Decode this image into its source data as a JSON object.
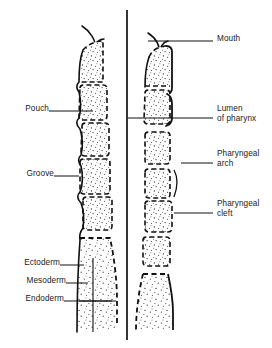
{
  "figure": {
    "ink_color": "#111111",
    "stipple_color": "#2b2b2b",
    "background": "#ffffff",
    "divider": {
      "x": 127,
      "y1": 10,
      "y2": 340
    }
  },
  "labels_left": [
    {
      "id": "pouch",
      "text": "Pouch",
      "x": 10,
      "y": 104,
      "leader": {
        "x1": 49,
        "y1": 111,
        "x2": 93,
        "y2": 111
      }
    },
    {
      "id": "groove",
      "text": "Groove",
      "x": 10,
      "y": 169,
      "leader": {
        "x1": 54,
        "y1": 176,
        "x2": 78,
        "y2": 176
      }
    },
    {
      "id": "ectoderm",
      "text": "Ectoderm",
      "x": 10,
      "y": 258,
      "leader": {
        "x1": 60,
        "y1": 265,
        "x2": 83,
        "y2": 265
      }
    },
    {
      "id": "mesoderm",
      "text": "Mesoderm",
      "x": 10,
      "y": 276,
      "leader": {
        "x1": 66,
        "y1": 283,
        "x2": 86,
        "y2": 283
      }
    },
    {
      "id": "endoderm",
      "text": "Endoderm",
      "x": 10,
      "y": 294,
      "leader": {
        "x1": 64,
        "y1": 301,
        "x2": 110,
        "y2": 301
      }
    }
  ],
  "labels_right": [
    {
      "id": "mouth",
      "text": "Mouth",
      "text2": "",
      "x": 217,
      "y": 34,
      "leader": {
        "x1": 148,
        "y1": 41,
        "x2": 213,
        "y2": 41
      }
    },
    {
      "id": "lumen-of-pharynx",
      "text": "Lumen",
      "text2": "of pharynx",
      "x": 217,
      "y": 104,
      "leader": {
        "x1": 130,
        "y1": 118,
        "x2": 213,
        "y2": 118
      }
    },
    {
      "id": "pharyngeal-arch",
      "text": "Pharyngeal",
      "text2": "arch",
      "x": 217,
      "y": 149,
      "leader": {
        "x1": 183,
        "y1": 163,
        "x2": 213,
        "y2": 163
      }
    },
    {
      "id": "pharyngeal-cleft",
      "text": "Pharyngeal",
      "text2": "cleft",
      "x": 217,
      "y": 199,
      "leader": {
        "x1": 175,
        "y1": 213,
        "x2": 213,
        "y2": 213
      }
    }
  ],
  "left_panel": {
    "name": "surface-view-of-pharyngeal-arches",
    "segment_count": 6,
    "has_mouth_hook": true,
    "has_body_wall_base": true
  },
  "right_panel": {
    "name": "sectioned-view-of-pharyngeal-arches",
    "segment_count": 6,
    "has_mouth_hook": true,
    "has_body_wall_base": true
  }
}
